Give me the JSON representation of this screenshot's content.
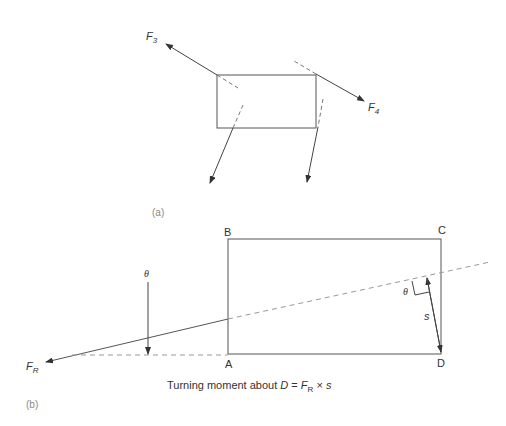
{
  "figure_a": {
    "panel_label": "(a)",
    "forces": [
      {
        "symbol": "F",
        "subscript": "3"
      },
      {
        "symbol": "F",
        "subscript": "4"
      }
    ]
  },
  "figure_b": {
    "panel_label": "(b)",
    "corners": {
      "a": "A",
      "b": "B",
      "c": "C",
      "d": "D"
    },
    "resultant": {
      "symbol": "F",
      "subscript": "R"
    },
    "angle_label": "θ",
    "distance_label": "s",
    "caption": {
      "prefix": "Turning moment about ",
      "point": "D",
      "equals": " = ",
      "force": "F",
      "force_sub": "R",
      "times": " × ",
      "distance": "s"
    }
  },
  "colors": {
    "line": "#555555",
    "dash": "#999999",
    "text": "#333333",
    "panel_label": "#888888"
  }
}
